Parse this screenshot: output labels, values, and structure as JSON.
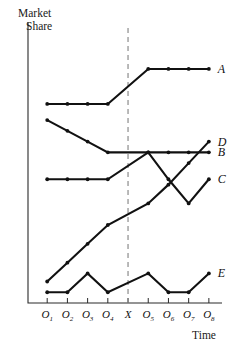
{
  "chart_data": {
    "type": "line",
    "title": "",
    "xlabel": "Time",
    "ylabel": "Market Share",
    "ylabel_lines": [
      "Market",
      "Share"
    ],
    "grid": false,
    "legend_position": "right-of-line-end",
    "x": [
      "O1",
      "O2",
      "O3",
      "O4",
      "O5",
      "O6",
      "O7",
      "O8"
    ],
    "xtick_labels": [
      {
        "base": "O",
        "sub": "1"
      },
      {
        "base": "O",
        "sub": "2"
      },
      {
        "base": "O",
        "sub": "3"
      },
      {
        "base": "O",
        "sub": "4"
      },
      {
        "base": "X",
        "sub": ""
      },
      {
        "base": "O",
        "sub": "5"
      },
      {
        "base": "O",
        "sub": "6"
      },
      {
        "base": "O",
        "sub": "7"
      },
      {
        "base": "O",
        "sub": "8"
      }
    ],
    "ylim": [
      0,
      100
    ],
    "xlim": [
      0,
      9
    ],
    "annotations": [
      {
        "name": "intervention-line",
        "label": "X",
        "x_position": "between O4 and O5",
        "style": "dashed vertical"
      }
    ],
    "series": [
      {
        "name": "A",
        "label": "A",
        "color": "#111111",
        "values": [
          74,
          74,
          74,
          74,
          87,
          87,
          87,
          87
        ],
        "description": "flat before X, steps up after X then flat"
      },
      {
        "name": "B",
        "label": "B",
        "color": "#111111",
        "values": [
          68,
          64,
          60,
          56,
          56,
          56,
          56,
          56
        ],
        "description": "declines before X, flat after X"
      },
      {
        "name": "C",
        "label": "C",
        "color": "#111111",
        "values": [
          46,
          46,
          46,
          46,
          56,
          46,
          37,
          46
        ],
        "description": "flat before X, peak at O5, dips to O7, rises at O8"
      },
      {
        "name": "D",
        "label": "D",
        "color": "#111111",
        "values": [
          8,
          15,
          22,
          29,
          37,
          44,
          52,
          60
        ],
        "description": "steady linear increase throughout"
      },
      {
        "name": "E",
        "label": "E",
        "color": "#111111",
        "values": [
          4,
          4,
          11,
          4,
          11,
          4,
          4,
          11
        ],
        "description": "zigzag oscillation, unchanged pattern across X"
      }
    ]
  },
  "labels": {
    "y_axis_line1": "Market",
    "y_axis_line2": "Share",
    "x_axis": "Time"
  }
}
